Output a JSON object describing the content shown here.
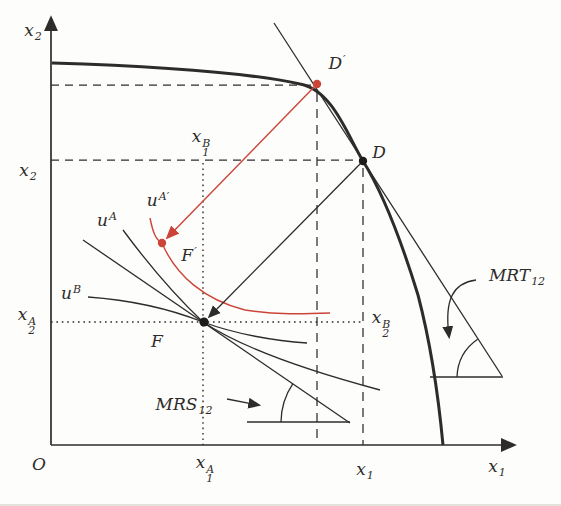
{
  "figure": {
    "kind": "economics-diagram"
  },
  "colors": {
    "ink": "#2e2c2b",
    "accent_red": "#cb4437"
  },
  "labels": {
    "origin": {
      "base": "O"
    },
    "axis_y": {
      "base": "x",
      "sub": "2"
    },
    "axis_x": {
      "base": "x",
      "sub": "1"
    },
    "y_d": {
      "base": "x",
      "sub": "2"
    },
    "y_f": {
      "base": "x",
      "sub": "2",
      "sup": "A"
    },
    "x_f": {
      "base": "x",
      "sub": "1",
      "sup": "A"
    },
    "x_d": {
      "base": "x",
      "sub": "1"
    },
    "x1b": {
      "base": "x",
      "sub": "1",
      "sup": "B"
    },
    "x2b": {
      "base": "x",
      "sub": "2",
      "sup": "B"
    },
    "d_prime": {
      "base": "D",
      "sup": "′"
    },
    "d": {
      "base": "D"
    },
    "f_prime": {
      "base": "F",
      "sup": "′"
    },
    "f": {
      "base": "F"
    },
    "u_a": {
      "base": "u",
      "sup": "A"
    },
    "u_a_prime": {
      "base": "u",
      "sup": "A′"
    },
    "u_b": {
      "base": "u",
      "sup": "B"
    },
    "mrs": {
      "base": "MRS",
      "sub": "12"
    },
    "mrt": {
      "base": "MRT",
      "sub": "12"
    }
  }
}
